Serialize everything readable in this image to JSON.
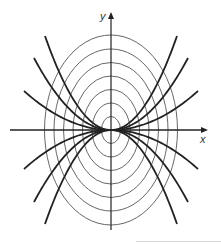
{
  "figure": {
    "x_axis_label": "x",
    "y_axis_label": "y",
    "center": [
      111,
      130
    ],
    "ellipses": {
      "count": 7,
      "color": "#555555",
      "semi_axes": [
        [
          9.5,
          13.5
        ],
        [
          19,
          27
        ],
        [
          28.5,
          40.5
        ],
        [
          38,
          54
        ],
        [
          47.5,
          67.5
        ],
        [
          57,
          81
        ],
        [
          66.5,
          95
        ]
      ]
    },
    "parabolas": {
      "color": "#222222",
      "endpoints_upper": [
        [
          -87,
          -39
        ],
        [
          -77,
          -72
        ],
        [
          -66,
          -94
        ],
        [
          87,
          -39
        ],
        [
          77,
          -72
        ],
        [
          66,
          -94
        ]
      ],
      "endpoints_lower": [
        [
          -87,
          39
        ],
        [
          -77,
          72
        ],
        [
          -66,
          94
        ],
        [
          87,
          39
        ],
        [
          77,
          72
        ],
        [
          66,
          94
        ]
      ]
    }
  }
}
